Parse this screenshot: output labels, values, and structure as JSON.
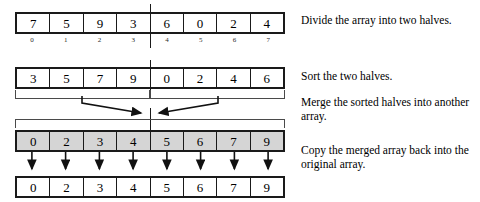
{
  "diagram": {
    "colors": {
      "stroke": "#1a1a1a",
      "bracket": "#4a4a4a",
      "merged_fill": "#d5d5d5",
      "background": "#ffffff",
      "text": "#000000"
    },
    "rows": [
      {
        "name": "original-array",
        "shaded": false,
        "values": [
          "7",
          "5",
          "9",
          "3",
          "6",
          "0",
          "2",
          "4"
        ]
      },
      {
        "name": "sorted-halves-array",
        "shaded": false,
        "values": [
          "3",
          "5",
          "7",
          "9",
          "0",
          "2",
          "4",
          "6"
        ]
      },
      {
        "name": "merged-array",
        "shaded": true,
        "values": [
          "0",
          "2",
          "3",
          "4",
          "5",
          "6",
          "7",
          "9"
        ]
      },
      {
        "name": "final-array",
        "shaded": false,
        "values": [
          "0",
          "2",
          "3",
          "4",
          "5",
          "6",
          "7",
          "9"
        ]
      }
    ],
    "indices": [
      "0",
      "1",
      "2",
      "3",
      "4",
      "5",
      "6",
      "7"
    ],
    "split_after_index": 3
  },
  "captions": {
    "divide": "Divide the array into two halves.",
    "sort": "Sort the two halves.",
    "merge": "Merge the sorted halves into another array.",
    "copy": "Copy the merged array back into the original array."
  }
}
